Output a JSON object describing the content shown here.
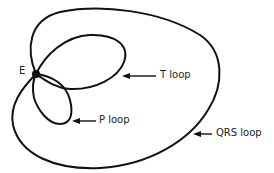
{
  "diagram": {
    "type": "vectorcardiogram",
    "origin_label": "E",
    "loops": [
      {
        "id": "qrs",
        "label": "QRS loop"
      },
      {
        "id": "t",
        "label": "T loop"
      },
      {
        "id": "p",
        "label": "P loop"
      }
    ],
    "colors": {
      "stroke": "#111111",
      "background": "#ffffff"
    }
  }
}
